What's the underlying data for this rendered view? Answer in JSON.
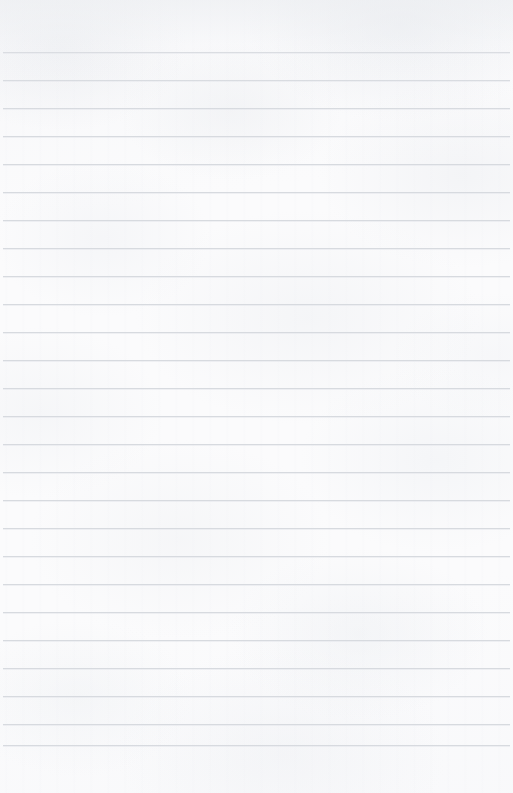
{
  "document": {
    "type": "lined-paper",
    "title": "Blank ruled notebook page",
    "text_content": "",
    "handwriting": "",
    "page_width": 513,
    "page_height": 793
  },
  "paper": {
    "background_color": "#fbfbfc",
    "edge_color": "#f2f3f5",
    "texture": "mottled-scanned-paper"
  },
  "ruling": {
    "line_color": "#d6d9de",
    "line_thickness": 1,
    "line_spacing": 28,
    "first_line_y": 52,
    "line_left_x": 3,
    "line_right_x": 510,
    "line_count": 26,
    "has_margin_rule": false,
    "line_positions": [
      52,
      80,
      108,
      136,
      164,
      192,
      220,
      248,
      276,
      304,
      332,
      360,
      388,
      416,
      444,
      472,
      500,
      528,
      556,
      584,
      612,
      640,
      668,
      696,
      724,
      745
    ]
  }
}
